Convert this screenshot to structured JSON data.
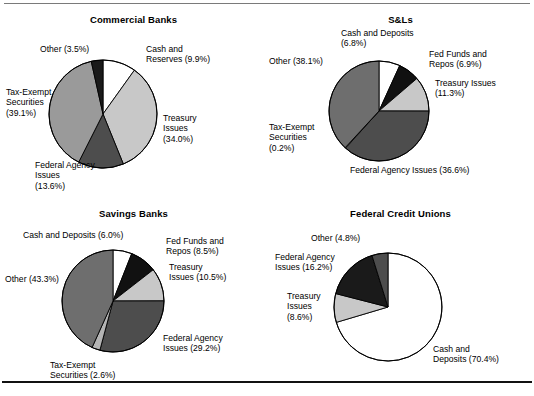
{
  "figure": {
    "background": "#ffffff",
    "rule_top_color": "#7a7a7a",
    "rule_bottom_color": "#111111"
  },
  "palette": {
    "cash": "#ffffff",
    "fed_funds": "#111111",
    "treasury": "#c8c8c8",
    "federal_agency": "#4d4d4d",
    "tax_exempt": "#9a9a9a",
    "other_dark": "#1a1a1a",
    "other_mid": "#6e6e6e",
    "outline": "#000000"
  },
  "chart_data": [
    {
      "type": "pie",
      "title": "Commercial Banks",
      "startangle": 90,
      "direction": "clockwise",
      "categories": [
        "Cash and Reserves",
        "Treasury Issues",
        "Federal Agency Issues",
        "Tax-Exempt Securities",
        "Other"
      ],
      "values": [
        9.9,
        34.0,
        13.6,
        39.1,
        3.5
      ],
      "colors": [
        "#ffffff",
        "#c8c8c8",
        "#4d4d4d",
        "#9a9a9a",
        "#1a1a1a"
      ],
      "labels": [
        "Cash and\nReserves (9.9%)",
        "Treasury\nIssues\n(34.0%)",
        "Federal Agency\nIssues\n(13.6%)",
        "Tax-Exempt\nSecurities\n(39.1%)",
        "Other (3.5%)"
      ]
    },
    {
      "type": "pie",
      "title": "S&Ls",
      "startangle": 90,
      "direction": "clockwise",
      "categories": [
        "Cash and Deposits",
        "Fed Funds and Repos",
        "Treasury Issues",
        "Federal Agency Issues",
        "Tax-Exempt Securities",
        "Other"
      ],
      "values": [
        6.8,
        6.9,
        11.3,
        36.6,
        0.2,
        38.1
      ],
      "colors": [
        "#ffffff",
        "#111111",
        "#c8c8c8",
        "#4d4d4d",
        "#ffffff",
        "#6e6e6e"
      ],
      "labels": [
        "Cash and Deposits\n(6.8%)",
        "Fed Funds and\nRepos (6.9%)",
        "Treasury Issues\n(11.3%)",
        "Federal Agency Issues (36.6%)",
        "Tax-Exempt\nSecurities\n(0.2%)",
        "Other (38.1%)"
      ]
    },
    {
      "type": "pie",
      "title": "Savings Banks",
      "startangle": 90,
      "direction": "clockwise",
      "categories": [
        "Cash and Deposits",
        "Fed Funds and Repos",
        "Treasury Issues",
        "Federal Agency Issues",
        "Tax-Exempt Securities",
        "Other"
      ],
      "values": [
        6.0,
        8.5,
        10.5,
        29.2,
        2.6,
        43.3
      ],
      "colors": [
        "#ffffff",
        "#111111",
        "#c8c8c8",
        "#4d4d4d",
        "#b4b4b4",
        "#6e6e6e"
      ],
      "labels": [
        "Cash and Deposits (6.0%)",
        "Fed Funds and\nRepos (8.5%)",
        "Treasury\nIssues (10.5%)",
        "Federal Agency\nIssues (29.2%)",
        "Tax-Exempt\nSecurities (2.6%)",
        "Other (43.3%)"
      ]
    },
    {
      "type": "pie",
      "title": "Federal Credit Unions",
      "startangle": 90,
      "direction": "clockwise",
      "categories": [
        "Cash and Deposits",
        "Treasury Issues",
        "Federal Agency Issues",
        "Other"
      ],
      "values": [
        70.4,
        8.6,
        16.2,
        4.8
      ],
      "colors": [
        "#ffffff",
        "#c8c8c8",
        "#1a1a1a",
        "#4d4d4d"
      ],
      "labels": [
        "Cash and\nDeposits (70.4%)",
        "Treasury\nIssues\n(8.6%)",
        "Federal Agency\nIssues (16.2%)",
        "Other (4.8%)"
      ]
    }
  ],
  "layout": {
    "panels": [
      {
        "cx": 103,
        "cy": 106,
        "r": 54,
        "label_positions": [
          {
            "x": 146,
            "y": 36,
            "align": "left"
          },
          {
            "x": 163,
            "y": 105,
            "align": "left"
          },
          {
            "x": 35,
            "y": 152,
            "align": "left"
          },
          {
            "x": 6,
            "y": 79,
            "align": "left"
          },
          {
            "x": 40,
            "y": 36,
            "align": "left"
          }
        ]
      },
      {
        "cx": 112,
        "cy": 103,
        "r": 50,
        "label_positions": [
          {
            "x": 74,
            "y": 20,
            "align": "left"
          },
          {
            "x": 162,
            "y": 41,
            "align": "left"
          },
          {
            "x": 168,
            "y": 70,
            "align": "left"
          },
          {
            "x": 83,
            "y": 157,
            "align": "left"
          },
          {
            "x": 2,
            "y": 114,
            "align": "left"
          },
          {
            "x": 2,
            "y": 48,
            "align": "left"
          }
        ]
      },
      {
        "cx": 113,
        "cy": 101,
        "r": 51,
        "label_positions": [
          {
            "x": 23,
            "y": 30,
            "align": "left"
          },
          {
            "x": 166,
            "y": 36,
            "align": "left"
          },
          {
            "x": 169,
            "y": 62,
            "align": "left"
          },
          {
            "x": 163,
            "y": 133,
            "align": "left"
          },
          {
            "x": 50,
            "y": 160,
            "align": "left"
          },
          {
            "x": 5,
            "y": 74,
            "align": "left"
          }
        ]
      },
      {
        "cx": 121,
        "cy": 107,
        "r": 54,
        "label_positions": [
          {
            "x": 166,
            "y": 144,
            "align": "left"
          },
          {
            "x": 20,
            "y": 91,
            "align": "left"
          },
          {
            "x": 8,
            "y": 52,
            "align": "left"
          },
          {
            "x": 44,
            "y": 33,
            "align": "left"
          }
        ]
      }
    ]
  }
}
